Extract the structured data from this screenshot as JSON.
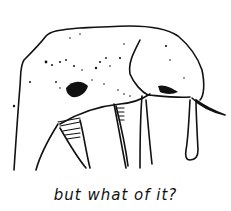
{
  "illustration": {
    "subject": "elephant sketch",
    "style": "hand-drawn ink line drawing",
    "ink_color": "#111111",
    "background_color": "#ffffff"
  },
  "caption": {
    "text": "but what of it?"
  }
}
